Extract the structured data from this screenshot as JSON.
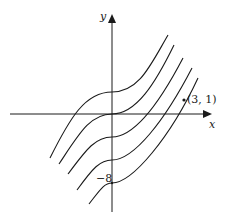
{
  "diagram": {
    "type": "family-of-curves",
    "axes": {
      "x_label": "x",
      "y_label": "y"
    },
    "annotations": {
      "y_intercept_label": "−8",
      "point_label": "(3, 1)"
    },
    "curve_count": 5,
    "colors": {
      "stroke": "#1a1a1a",
      "background": "#ffffff"
    }
  }
}
